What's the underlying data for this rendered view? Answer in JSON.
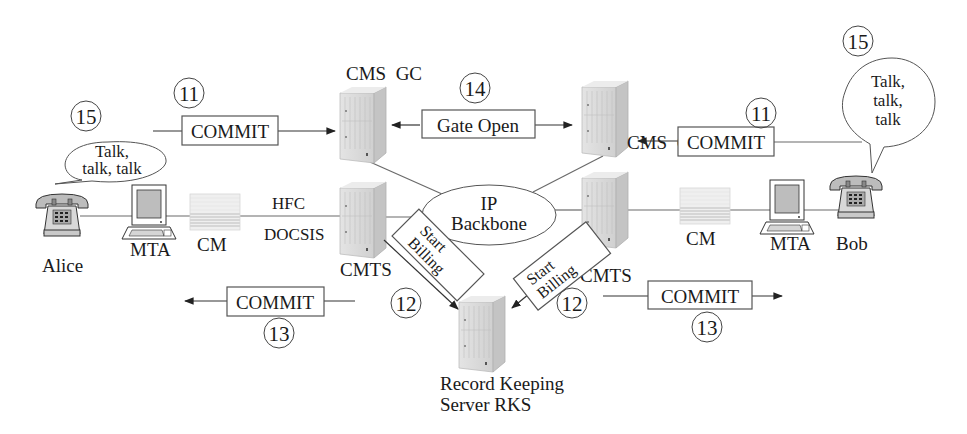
{
  "diagram": {
    "type": "PacketCable call setup / billing flow",
    "nodes": {
      "alice": {
        "label": "Alice"
      },
      "bob": {
        "label": "Bob"
      },
      "mta_left": {
        "label": "MTA"
      },
      "mta_right": {
        "label": "MTA"
      },
      "cm_left": {
        "label": "CM"
      },
      "cm_right": {
        "label": "CM"
      },
      "cmts_left": {
        "label": "CMTS"
      },
      "cmts_right": {
        "label": "CMTS"
      },
      "cms_gc_left": {
        "label": "CMS  GC"
      },
      "cms_gc_right": {
        "label": "CMS  GC"
      },
      "ip_backbone": {
        "line1": "IP",
        "line2": "Backbone"
      },
      "rks": {
        "line1": "Record Keeping",
        "line2": "Server RKS"
      }
    },
    "link_labels": {
      "hfc": "HFC",
      "docsis": "DOCSIS"
    },
    "messages": {
      "commit_top_left": {
        "label": "COMMIT",
        "step": "11"
      },
      "commit_top_right": {
        "label": "COMMIT",
        "step": "11"
      },
      "gate_open": {
        "label": "Gate Open",
        "step": "14"
      },
      "start_billing_left": {
        "line1": "Start",
        "line2": "Billing",
        "step": "12"
      },
      "start_billing_right": {
        "line1": "Start",
        "line2": "Billing",
        "step": "12"
      },
      "commit_bottom_left": {
        "label": "COMMIT",
        "step": "13"
      },
      "commit_bottom_right": {
        "label": "COMMIT",
        "step": "13"
      }
    },
    "speech": {
      "alice": {
        "line1": "Talk,",
        "line2": "talk, talk",
        "step": "15"
      },
      "bob": {
        "line1": "Talk,",
        "line2": "talk,",
        "line3": "talk",
        "step": "15"
      }
    },
    "colors": {
      "line": "#6a6a6a",
      "server_face": "#d9d9d9",
      "server_side": "#bdbdbd",
      "text": "#1a1a1a"
    }
  }
}
